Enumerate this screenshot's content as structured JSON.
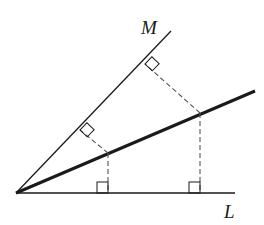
{
  "diagram": {
    "title": "",
    "labels": {
      "M": "M",
      "L": "L"
    },
    "vertex": {
      "x": 16,
      "y": 193
    },
    "lines": {
      "L": {
        "x1": 16,
        "y1": 193,
        "x2": 235,
        "y2": 193
      },
      "M": {
        "x1": 16,
        "y1": 193,
        "x2": 171,
        "y2": 31
      },
      "bisector": {
        "x1": 16,
        "y1": 193,
        "x2": 255,
        "y2": 91
      }
    },
    "points_on_bisector": [
      {
        "x": 108,
        "y": 153,
        "foot_on_M": {
          "x": 80,
          "y": 130
        },
        "foot_on_L": {
          "x": 108,
          "y": 193
        }
      },
      {
        "x": 200,
        "y": 113,
        "foot_on_M": {
          "x": 145,
          "y": 64
        },
        "foot_on_L": {
          "x": 200,
          "y": 193
        }
      }
    ],
    "colors": {
      "stroke": "#1a1a1a",
      "dashed": "#555555"
    }
  }
}
